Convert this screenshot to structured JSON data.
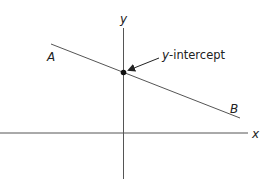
{
  "diagram": {
    "x_axis_label": "x",
    "y_axis_label": "y",
    "point_a_label": "A",
    "point_b_label": "B",
    "annotation_italic": "y",
    "annotation_rest": "-intercept",
    "colors": {
      "axis": "#555555",
      "line": "#555555",
      "dot": "#111111",
      "text": "#222222"
    }
  }
}
